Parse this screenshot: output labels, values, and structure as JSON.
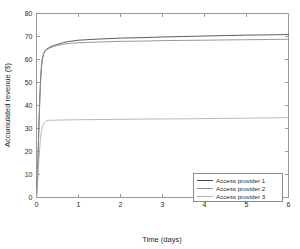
{
  "chart_data": {
    "type": "line",
    "title": "",
    "xlabel": "Time (days)",
    "ylabel": "Accumulated revenue ($)",
    "xlim": [
      0,
      6
    ],
    "ylim": [
      0,
      80
    ],
    "xticks": [
      0,
      1,
      2,
      3,
      4,
      5,
      6
    ],
    "yticks": [
      0,
      10,
      20,
      30,
      40,
      50,
      60,
      70,
      80
    ],
    "xticklabels": [
      "0",
      "1",
      "2",
      "3",
      "4",
      "5",
      "6"
    ],
    "yticklabels": [
      "0",
      "10",
      "20",
      "30",
      "40",
      "50",
      "60",
      "70",
      "80"
    ],
    "grid": false,
    "legend_position": "lower right",
    "series": [
      {
        "name": "Access provider 1",
        "color": "#4a4a4a",
        "x": [
          0,
          0.02,
          0.04,
          0.06,
          0.08,
          0.1,
          0.12,
          0.14,
          0.16,
          0.18,
          0.2,
          0.25,
          0.3,
          0.4,
          0.5,
          0.65,
          0.8,
          1.0,
          1.2,
          1.5,
          2.0,
          2.5,
          3.0,
          3.5,
          4.0,
          4.5,
          5.0,
          5.5,
          5.8,
          6.0
        ],
        "y": [
          0,
          8.5,
          20.0,
          33.5,
          44.0,
          52.0,
          57.5,
          60.5,
          62.0,
          63.0,
          63.8,
          64.6,
          65.2,
          66.0,
          66.6,
          67.4,
          67.9,
          68.4,
          68.6,
          68.9,
          69.3,
          69.5,
          69.8,
          70.0,
          70.2,
          70.4,
          70.6,
          70.7,
          70.8,
          70.9
        ]
      },
      {
        "name": "Access provider 2",
        "color": "#8f8f8f",
        "x": [
          0,
          0.02,
          0.04,
          0.06,
          0.08,
          0.1,
          0.12,
          0.14,
          0.16,
          0.18,
          0.2,
          0.25,
          0.3,
          0.4,
          0.5,
          0.65,
          0.8,
          1.0,
          1.2,
          1.5,
          2.0,
          2.5,
          3.0,
          3.5,
          4.0,
          4.5,
          5.0,
          5.5,
          5.8,
          6.0
        ],
        "y": [
          0,
          8.0,
          19.0,
          32.0,
          43.0,
          51.0,
          56.8,
          60.0,
          61.6,
          62.7,
          63.5,
          64.3,
          64.9,
          65.6,
          66.1,
          66.7,
          67.0,
          67.3,
          67.4,
          67.6,
          67.9,
          68.0,
          68.2,
          68.3,
          68.4,
          68.5,
          68.6,
          68.7,
          68.75,
          68.8
        ]
      },
      {
        "name": "Access provider 3",
        "color": "#b0b0b0",
        "x": [
          0,
          0.02,
          0.04,
          0.06,
          0.08,
          0.1,
          0.12,
          0.14,
          0.16,
          0.18,
          0.2,
          0.22,
          0.25,
          0.28,
          0.3,
          0.4,
          0.6,
          1.0,
          1.5,
          2.0,
          2.5,
          3.0,
          3.5,
          4.0,
          4.5,
          5.0,
          5.5,
          5.8,
          6.0
        ],
        "y": [
          0,
          4.5,
          10.5,
          17.0,
          22.5,
          26.5,
          29.0,
          30.6,
          31.6,
          32.3,
          32.8,
          33.1,
          33.4,
          33.5,
          33.55,
          33.6,
          33.7,
          33.8,
          33.9,
          34.0,
          34.1,
          34.15,
          34.2,
          34.3,
          34.4,
          34.5,
          34.6,
          34.65,
          34.7
        ]
      }
    ]
  },
  "legend": {
    "entries": [
      {
        "label": "Access provider 1"
      },
      {
        "label": "Access provider 2"
      },
      {
        "label": "Access provider 3"
      }
    ]
  },
  "colors": {
    "axis": "#9a9a9a",
    "text": "#1f1f1f",
    "background": "#ffffff"
  }
}
